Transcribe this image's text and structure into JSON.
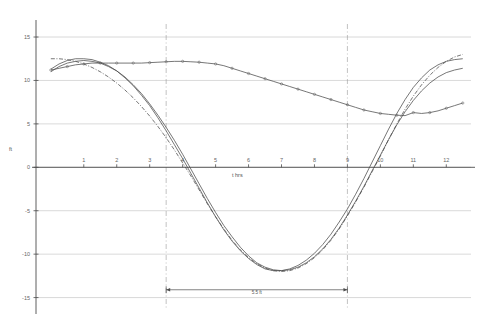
{
  "chart_data": {
    "type": "line",
    "title": "",
    "xlabel": "t  hrs",
    "ylabel": "ft",
    "xlim": [
      -0.45,
      12.75
    ],
    "ylim": [
      -16.2,
      16.5
    ],
    "xticks": [
      1,
      2,
      3,
      4,
      5,
      6,
      7,
      8,
      9,
      10,
      11,
      12
    ],
    "yticks": [
      15,
      10,
      5,
      0,
      -5,
      -10,
      -15
    ],
    "grid": true,
    "legend": "none",
    "x": [
      0,
      0.25,
      0.5,
      0.75,
      1,
      1.25,
      1.5,
      1.75,
      2,
      2.25,
      2.5,
      2.75,
      3,
      3.25,
      3.5,
      3.75,
      4,
      4.25,
      4.5,
      4.75,
      5,
      5.25,
      5.5,
      5.75,
      6,
      6.25,
      6.5,
      6.75,
      7,
      7.25,
      7.5,
      7.75,
      8,
      8.25,
      8.5,
      8.75,
      9,
      9.25,
      9.5,
      9.75,
      10,
      10.25,
      10.5,
      10.75,
      11,
      11.25,
      11.5,
      11.75,
      12,
      12.25,
      12.5
    ],
    "series": [
      {
        "name": "upper-curve-markers",
        "marker": "circle",
        "style": "solid",
        "values": [
          11.2,
          11.4,
          11.6,
          11.8,
          11.9,
          12.0,
          12.0,
          12.0,
          12.0,
          12.0,
          12.0,
          12.0,
          12.05,
          12.1,
          12.15,
          12.2,
          12.2,
          12.15,
          12.1,
          12.0,
          11.9,
          11.7,
          11.4,
          11.1,
          10.8,
          10.5,
          10.2,
          9.9,
          9.6,
          9.3,
          9.0,
          8.7,
          8.4,
          8.1,
          7.8,
          7.5,
          7.2,
          6.9,
          6.6,
          6.4,
          6.2,
          6.1,
          6.0,
          5.95,
          6.3,
          6.2,
          6.3,
          6.5,
          6.8,
          7.1,
          7.4
        ]
      },
      {
        "name": "curve-a-solid",
        "marker": "none",
        "style": "solid",
        "values": [
          11.0,
          11.6,
          12.0,
          12.2,
          12.3,
          12.2,
          12.0,
          11.6,
          11.1,
          10.4,
          9.5,
          8.5,
          7.3,
          6.0,
          4.6,
          3.1,
          1.5,
          -0.2,
          -1.9,
          -3.6,
          -5.2,
          -6.7,
          -8.0,
          -9.2,
          -10.2,
          -11.0,
          -11.5,
          -11.8,
          -11.9,
          -11.8,
          -11.5,
          -11.0,
          -10.3,
          -9.4,
          -8.3,
          -7.0,
          -5.5,
          -3.9,
          -2.2,
          -0.4,
          1.4,
          3.2,
          4.9,
          6.4,
          7.7,
          8.8,
          9.7,
          10.4,
          10.9,
          11.2,
          11.4
        ]
      },
      {
        "name": "curve-b-solid",
        "marker": "none",
        "style": "solid",
        "values": [
          11.3,
          11.9,
          12.3,
          12.5,
          12.5,
          12.4,
          12.1,
          11.7,
          11.1,
          10.3,
          9.4,
          8.3,
          7.1,
          5.7,
          4.2,
          2.6,
          1.0,
          -0.7,
          -2.4,
          -4.1,
          -5.7,
          -7.2,
          -8.5,
          -9.6,
          -10.5,
          -11.2,
          -11.7,
          -11.9,
          -11.9,
          -11.7,
          -11.3,
          -10.7,
          -9.9,
          -8.9,
          -7.7,
          -6.3,
          -4.8,
          -3.1,
          -1.3,
          0.6,
          2.5,
          4.4,
          6.2,
          7.8,
          9.2,
          10.3,
          11.2,
          11.8,
          12.2,
          12.4,
          12.5
        ]
      },
      {
        "name": "curve-c-dashdot",
        "marker": "none",
        "style": "dashdot",
        "values": [
          12.5,
          12.5,
          12.4,
          12.2,
          11.9,
          11.5,
          11.0,
          10.4,
          9.7,
          8.9,
          8.0,
          7.0,
          5.9,
          4.7,
          3.4,
          2.0,
          0.5,
          -1.0,
          -2.6,
          -4.2,
          -5.7,
          -7.1,
          -8.4,
          -9.5,
          -10.4,
          -11.1,
          -11.6,
          -11.9,
          -12.0,
          -11.9,
          -11.6,
          -11.1,
          -10.4,
          -9.5,
          -8.4,
          -7.1,
          -5.6,
          -4.0,
          -2.3,
          -0.5,
          1.3,
          3.2,
          5.0,
          6.7,
          8.2,
          9.5,
          10.6,
          11.5,
          12.2,
          12.7,
          13.0
        ]
      }
    ],
    "vertical_markers": [
      {
        "name": "dashed-line-left",
        "x": 3.5
      },
      {
        "name": "dashed-line-right",
        "x": 9.0
      }
    ],
    "annotations": [
      {
        "name": "span-dimension",
        "label": "5.5 ft",
        "x_start": 3.5,
        "x_end": 9.0,
        "y": -14.1
      }
    ]
  }
}
